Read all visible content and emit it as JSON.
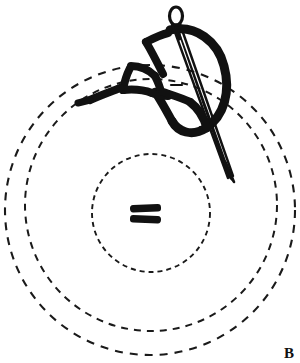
{
  "figure": {
    "panel_label": "B",
    "background_color": "#ffffff",
    "ink_color": "#111111",
    "dash_color": "#1a1a1a"
  },
  "membrane": {
    "description": "Three concentric dashed circles representing membrane rings",
    "center": {
      "x": 151,
      "y": 207
    },
    "rings": [
      {
        "name": "inner-ring",
        "radius": 59,
        "center_x": 151,
        "center_y": 213,
        "dash_pattern": "5 4",
        "stroke_width": 1.9
      },
      {
        "name": "middle-ring",
        "radius": 126,
        "center_x": 151,
        "center_y": 205,
        "dash_pattern": "7 6",
        "stroke_width": 2.0
      },
      {
        "name": "outer-ring",
        "radius": 145,
        "center_x": 150,
        "center_y": 210,
        "dash_pattern": "8 7",
        "stroke_width": 2.1
      }
    ]
  },
  "center_marker": {
    "name": "central-double-bar-marker",
    "description": "Two short thick horizontal bars at the center of the inner ring",
    "bars": [
      {
        "x": 130,
        "y": 205,
        "width": 30,
        "height": 7,
        "rotation_deg": -2
      },
      {
        "x": 130,
        "y": 215,
        "width": 30,
        "height": 7,
        "rotation_deg": 2
      }
    ]
  },
  "needle": {
    "name": "curved-surgical-needle",
    "description": "Straight needle shaft with eye at top, tip pointing down-right",
    "eye": {
      "cx": 176,
      "cy": 17,
      "rx": 7,
      "ry": 9
    },
    "shaft_top": {
      "x": 176,
      "y": 26
    },
    "shaft_tip": {
      "x": 233,
      "y": 181
    },
    "stroke_width": 2.2
  },
  "suture_thread": {
    "name": "suture-thread",
    "description": "Heavy black thread looping through the needle eye, forming a knot at left and a large loop at right",
    "stroke_width": 8,
    "segments": [
      {
        "name": "thread-large-right-loop"
      },
      {
        "name": "thread-through-eye"
      },
      {
        "name": "thread-upper-left-branch"
      },
      {
        "name": "thread-knot-cluster"
      },
      {
        "name": "thread-left-tail"
      }
    ]
  }
}
